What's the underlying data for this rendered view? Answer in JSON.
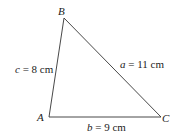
{
  "diagram": {
    "type": "triangle",
    "vertices": [
      {
        "name": "A",
        "x": 49,
        "y": 117
      },
      {
        "name": "B",
        "x": 64,
        "y": 18
      },
      {
        "name": "C",
        "x": 161,
        "y": 117
      }
    ],
    "sides": [
      {
        "var": "a",
        "eq": " = 11 cm",
        "between": "B-C"
      },
      {
        "var": "b",
        "eq": " = 9 cm",
        "between": "A-C"
      },
      {
        "var": "c",
        "eq": " = 8 cm",
        "between": "A-B"
      }
    ],
    "stroke_color": "#333333"
  }
}
